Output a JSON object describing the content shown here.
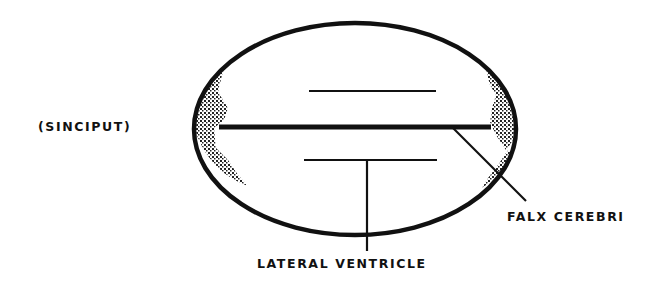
{
  "diagram": {
    "type": "anatomical-schematic",
    "colors": {
      "ink": "#111111",
      "background": "#ffffff",
      "stipple": "#222222"
    },
    "labels": {
      "sinciput": "(SINCIPUT)",
      "falx_cerebri": "FALX CEREBRI",
      "lateral_ventricle": "LATERAL VENTRICLE"
    },
    "shapes": {
      "head_outline": {
        "cx": 355,
        "cy": 129,
        "rx": 161,
        "ry": 106
      },
      "upper_ventricle_line": {
        "x1": 309,
        "y1": 91,
        "x2": 436,
        "y2": 91
      },
      "falx_line": {
        "x1": 219,
        "y1": 127,
        "x2": 491,
        "y2": 127
      },
      "lower_ventricle_line": {
        "x1": 304,
        "y1": 160,
        "x2": 437,
        "y2": 160
      },
      "ventricle_leader": {
        "x1": 367,
        "y1": 160,
        "x2": 367,
        "y2": 251
      },
      "falx_leader": {
        "x1": 453,
        "y1": 128,
        "x2": 526,
        "y2": 201
      }
    }
  }
}
